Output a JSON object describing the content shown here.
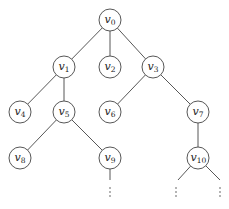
{
  "diagram": {
    "type": "tree",
    "node_radius": 11,
    "stroke_color": "#444444",
    "nodes": [
      {
        "id": "v0",
        "base": "v",
        "sub": "0",
        "x": 110,
        "y": 20
      },
      {
        "id": "v1",
        "base": "v",
        "sub": "1",
        "x": 64,
        "y": 67
      },
      {
        "id": "v2",
        "base": "v",
        "sub": "2",
        "x": 110,
        "y": 67
      },
      {
        "id": "v3",
        "base": "v",
        "sub": "3",
        "x": 153,
        "y": 67
      },
      {
        "id": "v4",
        "base": "v",
        "sub": "4",
        "x": 20,
        "y": 112
      },
      {
        "id": "v5",
        "base": "v",
        "sub": "5",
        "x": 64,
        "y": 112
      },
      {
        "id": "v6",
        "base": "v",
        "sub": "6",
        "x": 110,
        "y": 112
      },
      {
        "id": "v7",
        "base": "v",
        "sub": "7",
        "x": 198,
        "y": 112
      },
      {
        "id": "v8",
        "base": "v",
        "sub": "8",
        "x": 20,
        "y": 158
      },
      {
        "id": "v9",
        "base": "v",
        "sub": "9",
        "x": 110,
        "y": 158
      },
      {
        "id": "v10",
        "base": "v",
        "sub": "10",
        "x": 198,
        "y": 158
      }
    ],
    "edges": [
      [
        "v0",
        "v1"
      ],
      [
        "v0",
        "v2"
      ],
      [
        "v0",
        "v3"
      ],
      [
        "v1",
        "v4"
      ],
      [
        "v1",
        "v5"
      ],
      [
        "v3",
        "v6"
      ],
      [
        "v3",
        "v7"
      ],
      [
        "v5",
        "v8"
      ],
      [
        "v5",
        "v9"
      ],
      [
        "v7",
        "v10"
      ]
    ],
    "open_ends": [
      {
        "from": "v9",
        "x2": 110,
        "y2": 180,
        "dots_x": 110,
        "dots_y": 192
      },
      {
        "from": "v10",
        "x2": 178,
        "y2": 180,
        "dots_x": 176,
        "dots_y": 192
      },
      {
        "from": "v10",
        "x2": 220,
        "y2": 180,
        "dots_x": 220,
        "dots_y": 192
      }
    ],
    "continuation_symbol": "⋮"
  }
}
